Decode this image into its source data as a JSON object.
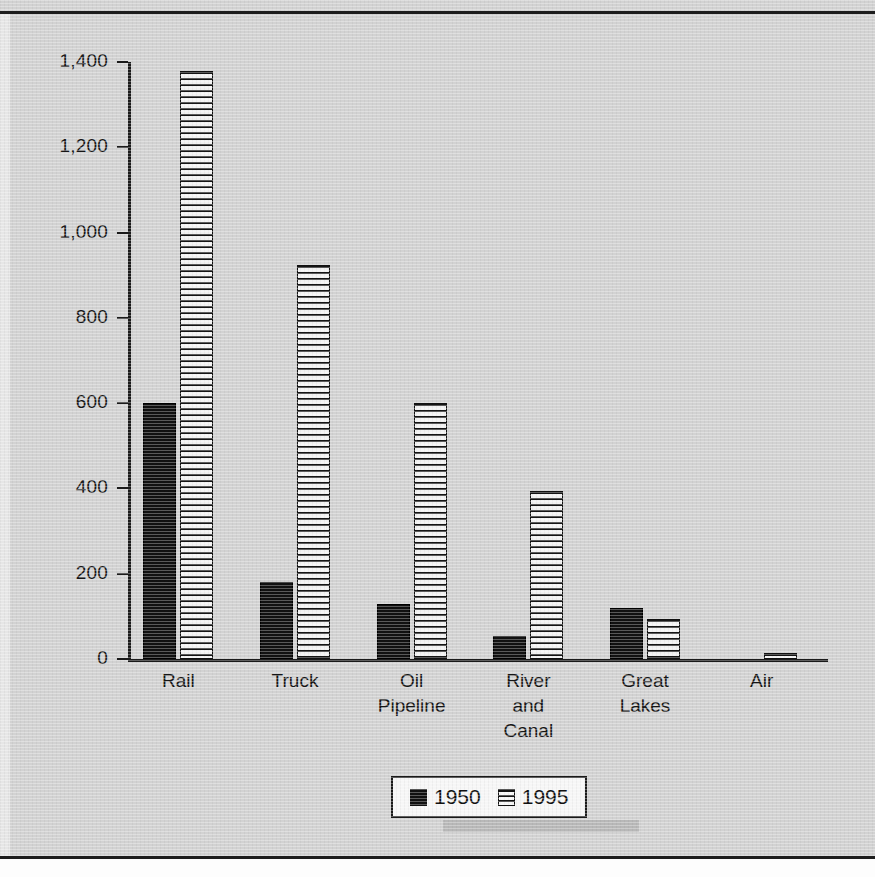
{
  "chart_data": {
    "type": "bar",
    "title": "",
    "xlabel": "",
    "ylabel": "Billions of Ton-Miles",
    "categories": [
      "Rail",
      "Truck",
      "Oil\nPipeline",
      "River\nand\nCanal",
      "Great\nLakes",
      "Air"
    ],
    "category_lines": [
      [
        "Rail"
      ],
      [
        "Truck"
      ],
      [
        "Oil",
        "Pipeline"
      ],
      [
        "River",
        "and",
        "Canal"
      ],
      [
        "Great",
        "Lakes"
      ],
      [
        "Air"
      ]
    ],
    "series": [
      {
        "name": "1950",
        "values": [
          600,
          180,
          130,
          55,
          120,
          0
        ],
        "color": "#111111",
        "fill": "solid"
      },
      {
        "name": "1995",
        "values": [
          1380,
          925,
          600,
          395,
          95,
          15
        ],
        "color": "#f2f2f2",
        "fill": "horizontal-stripes"
      }
    ],
    "ylim": [
      0,
      1400
    ],
    "ytick_values": [
      0,
      200,
      400,
      600,
      800,
      1000,
      1200,
      1400
    ],
    "ytick_labels": [
      "0",
      "200",
      "400",
      "600",
      "800",
      "1,000",
      "1,200",
      "1,400"
    ],
    "grid": false,
    "legend_position": "bottom-center",
    "legend_entries": [
      "1950",
      "1995"
    ]
  },
  "legend": {
    "items": [
      {
        "label": "1950",
        "swatch": "solid-black-square"
      },
      {
        "label": "1995",
        "swatch": "horizontal-striped-square"
      }
    ]
  },
  "axes": {
    "y_title": "Billions of Ton-Miles"
  }
}
